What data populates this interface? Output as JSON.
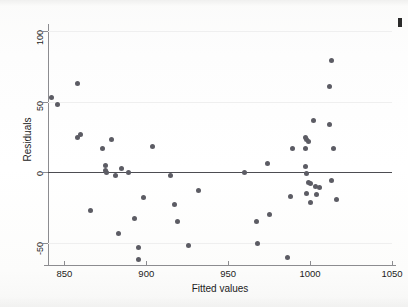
{
  "chart_data": {
    "type": "scatter",
    "title": "",
    "xlabel": "Fitted values",
    "ylabel": "Residuals",
    "xlim": [
      840,
      1050
    ],
    "ylim": [
      -65,
      105
    ],
    "xticks": [
      850,
      900,
      950,
      1000,
      1050
    ],
    "yticks": [
      100,
      50,
      0,
      -50
    ],
    "grid": "horizontal-faint",
    "legend": "none",
    "reference_line": {
      "orientation": "horizontal",
      "y": 0,
      "color": "#4d4d52"
    },
    "marker": {
      "shape": "circle",
      "color": "#5c5c64",
      "size_px": 5
    },
    "points": [
      {
        "x": 842,
        "y": 53
      },
      {
        "x": 846,
        "y": 48
      },
      {
        "x": 858,
        "y": 63
      },
      {
        "x": 858,
        "y": 25
      },
      {
        "x": 860,
        "y": 27
      },
      {
        "x": 866,
        "y": -27
      },
      {
        "x": 873,
        "y": 17
      },
      {
        "x": 875,
        "y": 5
      },
      {
        "x": 875,
        "y": 1
      },
      {
        "x": 876,
        "y": 0
      },
      {
        "x": 879,
        "y": 23
      },
      {
        "x": 881,
        "y": -2
      },
      {
        "x": 883,
        "y": -43
      },
      {
        "x": 885,
        "y": 3
      },
      {
        "x": 889,
        "y": 0
      },
      {
        "x": 893,
        "y": -33
      },
      {
        "x": 895,
        "y": -53
      },
      {
        "x": 895,
        "y": -62
      },
      {
        "x": 898,
        "y": -18
      },
      {
        "x": 904,
        "y": 18
      },
      {
        "x": 915,
        "y": -2
      },
      {
        "x": 917,
        "y": -23
      },
      {
        "x": 919,
        "y": -35
      },
      {
        "x": 926,
        "y": -52
      },
      {
        "x": 932,
        "y": -13
      },
      {
        "x": 960,
        "y": 0
      },
      {
        "x": 967,
        "y": -35
      },
      {
        "x": 968,
        "y": -50
      },
      {
        "x": 974,
        "y": 6
      },
      {
        "x": 975,
        "y": -30
      },
      {
        "x": 986,
        "y": -60
      },
      {
        "x": 988,
        "y": -17
      },
      {
        "x": 989,
        "y": 17
      },
      {
        "x": 997,
        "y": 25
      },
      {
        "x": 997,
        "y": 17
      },
      {
        "x": 997,
        "y": 4
      },
      {
        "x": 998,
        "y": 23
      },
      {
        "x": 998,
        "y": -1
      },
      {
        "x": 998,
        "y": -15
      },
      {
        "x": 999,
        "y": 22
      },
      {
        "x": 999,
        "y": -7
      },
      {
        "x": 1000,
        "y": -8
      },
      {
        "x": 1000,
        "y": -21
      },
      {
        "x": 1002,
        "y": 37
      },
      {
        "x": 1003,
        "y": -10
      },
      {
        "x": 1004,
        "y": -16
      },
      {
        "x": 1006,
        "y": -11
      },
      {
        "x": 1012,
        "y": 34
      },
      {
        "x": 1012,
        "y": 61
      },
      {
        "x": 1013,
        "y": 79
      },
      {
        "x": 1013,
        "y": -6
      },
      {
        "x": 1014,
        "y": 17
      },
      {
        "x": 1016,
        "y": -19
      }
    ]
  },
  "axes": {
    "x_tick_labels": [
      "850",
      "900",
      "950",
      "1000",
      "1050"
    ],
    "y_tick_labels": [
      "100",
      "50",
      "0",
      "-50"
    ],
    "x_title": "Fitted values",
    "y_title": "Residuals"
  },
  "figure": {
    "background_color": "#fdfdfc",
    "axis_color": "#8c8c90",
    "grid_color": "#efefef",
    "point_color": "#5c5c64",
    "zero_line_color": "#4d4d52"
  }
}
